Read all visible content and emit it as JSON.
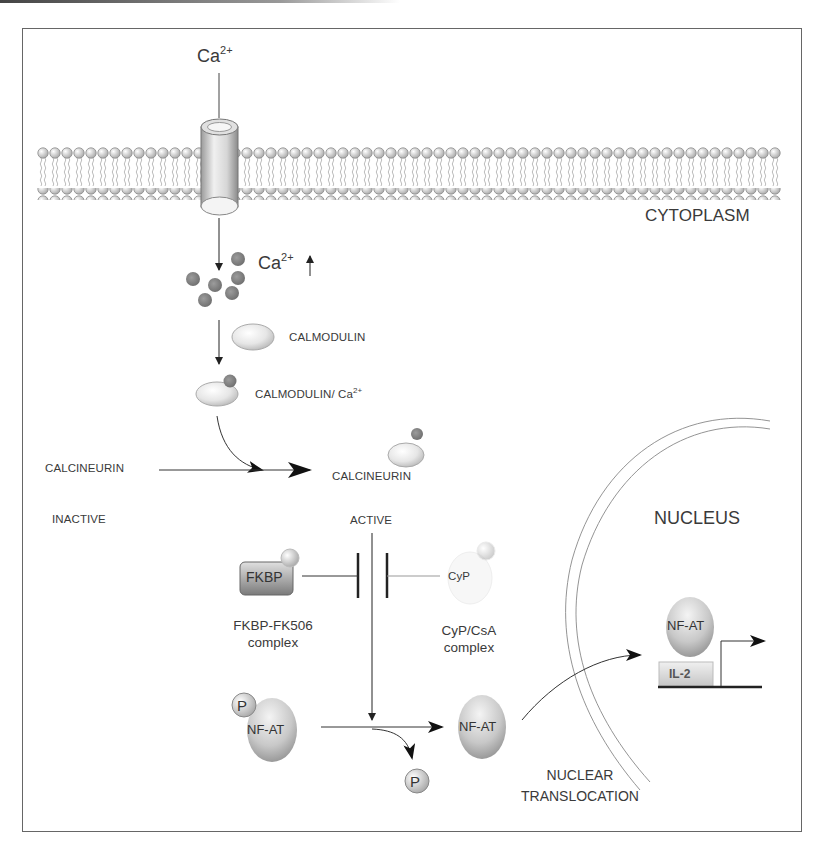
{
  "figure": {
    "colors": {
      "frame": "#666666",
      "ion": "#8a8a8a",
      "protein_light": "#e8e8e8",
      "protein_dark": "#9a9a9a",
      "text": "#3a3a3a"
    }
  },
  "labels": {
    "ca_extracellular": {
      "base": "Ca",
      "sup": "2+"
    },
    "cytoplasm": "CYTOPLASM",
    "ca_increase": {
      "base": "Ca",
      "sup": "2+",
      "arrow": "↑"
    },
    "calmodulin": "CALMODULIN",
    "calmodulin_ca": {
      "base": "CALMODULIN/ Ca",
      "sup": "2+"
    },
    "calcineurin_inactive": "CALCINEURIN",
    "inactive": "INACTIVE",
    "calcineurin_active": "CALCINEURIN",
    "active": "ACTIVE",
    "fkbp": "FKBP",
    "cyp": "CyP",
    "fkbp_complex_line1": "FKBP-FK506",
    "fkbp_complex_line2": "complex",
    "cyp_complex_line1": "CyP/CsA",
    "cyp_complex_line2": "complex",
    "nfat_phospho": "NF-AT",
    "phosphate_attached": "P",
    "nfat_free": "NF-AT",
    "phosphate_released": "P",
    "nuclear_translocation_line1": "NUCLEAR",
    "nuclear_translocation_line2": "TRANSLOCATION",
    "nucleus": "NUCLEUS",
    "nfat_nuclear": "NF-AT",
    "il2": "IL-2"
  }
}
